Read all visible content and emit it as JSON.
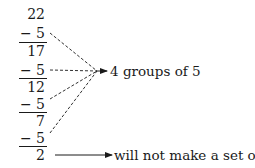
{
  "diagram": {
    "start_value": "22",
    "steps": [
      {
        "operator": "−",
        "subtrahend": "5",
        "result": "17"
      },
      {
        "operator": "−",
        "subtrahend": "5",
        "result": "12"
      },
      {
        "operator": "−",
        "subtrahend": "5",
        "result": "7"
      },
      {
        "operator": "−",
        "subtrahend": "5",
        "result": "2"
      }
    ],
    "groups_label": "4 groups of 5",
    "remainder_label": "will not make a set of 5"
  }
}
